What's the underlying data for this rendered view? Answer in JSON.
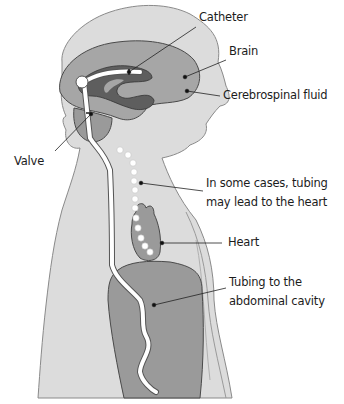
{
  "diagram": {
    "labels": {
      "catheter": "Catheter",
      "brain": "Brain",
      "csf": "Cerebrospinal fluid",
      "valve": "Valve",
      "heart_line1": "In some cases, tubing",
      "heart_line2": "may lead to the heart",
      "heart": "Heart",
      "abdomen_line1": "Tubing to the",
      "abdomen_line2": "abdominal cavity"
    },
    "colors": {
      "body": "#dcdcdc",
      "outline": "#8a8a8a",
      "brain": "#a6a6a6",
      "ventricle": "#5e5e5e",
      "organ": "#9a9a9a",
      "tube": "#ffffff",
      "leader": "#222222"
    }
  }
}
